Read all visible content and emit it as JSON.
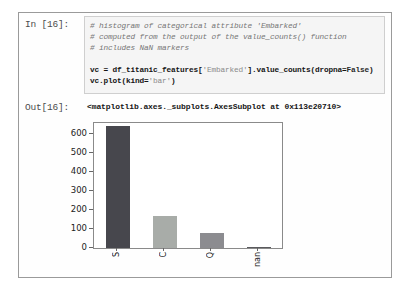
{
  "notebook": {
    "in_label": "In [16]:",
    "out_label": "Out[16]:",
    "out_value": "<matplotlib.axes._subplots.AxesSubplot at 0x113e20710>",
    "code_lines": [
      {
        "segments": [
          {
            "text": "# histogram of categorical attribute 'Embarked'",
            "style": "comment"
          }
        ]
      },
      {
        "segments": [
          {
            "text": "# computed from the output of the value_counts() function",
            "style": "comment"
          }
        ]
      },
      {
        "segments": [
          {
            "text": "# includes NaN markers",
            "style": "comment"
          }
        ]
      },
      {
        "segments": []
      },
      {
        "segments": [
          {
            "text": "vc = df_titanic_features[",
            "style": "code"
          },
          {
            "text": "'Embarked'",
            "style": "string"
          },
          {
            "text": "].value_counts(dropna=",
            "style": "code"
          },
          {
            "text": "False",
            "style": "keyword"
          },
          {
            "text": ")",
            "style": "code"
          }
        ]
      },
      {
        "segments": [
          {
            "text": "vc.plot(kind=",
            "style": "code"
          },
          {
            "text": "'bar'",
            "style": "string"
          },
          {
            "text": ")",
            "style": "code"
          }
        ]
      }
    ]
  },
  "chart_data": {
    "type": "bar",
    "title": "",
    "xlabel": "",
    "ylabel": "",
    "categories": [
      "S",
      "C",
      "Q",
      "nan"
    ],
    "values": [
      644,
      168,
      77,
      2
    ],
    "bar_colors": [
      "#47474d",
      "#a8aca8",
      "#8c8c90",
      "#5a5a5e"
    ],
    "yticks": [
      0,
      100,
      200,
      300,
      400,
      500,
      600
    ],
    "ylim": [
      0,
      660
    ],
    "grid": false,
    "legend": false,
    "bar_width_px": 24,
    "axis_color": "#8a8a8a"
  }
}
